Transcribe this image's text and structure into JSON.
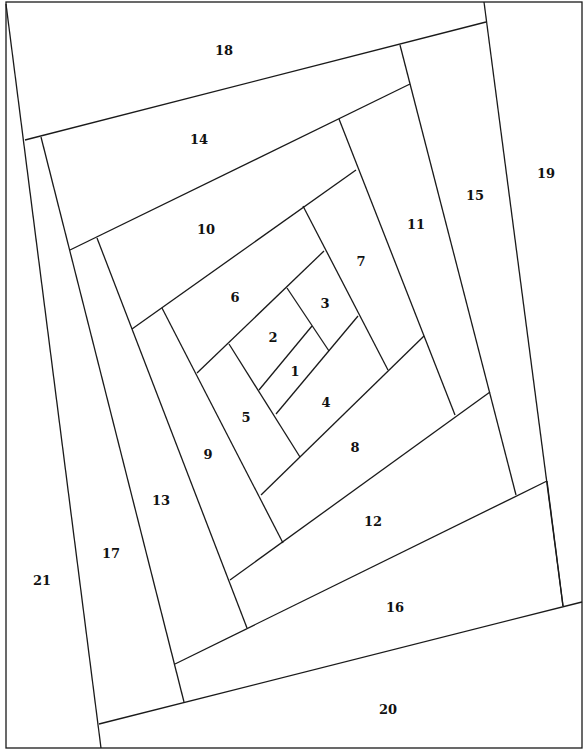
{
  "diagram": {
    "type": "log-cabin quilt foundation pattern (spiral)",
    "line_color": "#1a1a1a",
    "pieces": [
      {
        "n": "1",
        "x": 295,
        "y": 371
      },
      {
        "n": "2",
        "x": 273,
        "y": 337
      },
      {
        "n": "3",
        "x": 325,
        "y": 303
      },
      {
        "n": "4",
        "x": 326,
        "y": 402
      },
      {
        "n": "5",
        "x": 246,
        "y": 417
      },
      {
        "n": "6",
        "x": 235,
        "y": 297
      },
      {
        "n": "7",
        "x": 361,
        "y": 261
      },
      {
        "n": "8",
        "x": 355,
        "y": 447
      },
      {
        "n": "9",
        "x": 208,
        "y": 454
      },
      {
        "n": "10",
        "x": 206,
        "y": 229
      },
      {
        "n": "11",
        "x": 416,
        "y": 224
      },
      {
        "n": "12",
        "x": 373,
        "y": 521
      },
      {
        "n": "13",
        "x": 161,
        "y": 500
      },
      {
        "n": "14",
        "x": 199,
        "y": 139
      },
      {
        "n": "15",
        "x": 475,
        "y": 195
      },
      {
        "n": "16",
        "x": 395,
        "y": 607
      },
      {
        "n": "17",
        "x": 111,
        "y": 553
      },
      {
        "n": "18",
        "x": 224,
        "y": 50
      },
      {
        "n": "19",
        "x": 546,
        "y": 173
      },
      {
        "n": "20",
        "x": 388,
        "y": 709
      },
      {
        "n": "21",
        "x": 42,
        "y": 580
      }
    ]
  }
}
